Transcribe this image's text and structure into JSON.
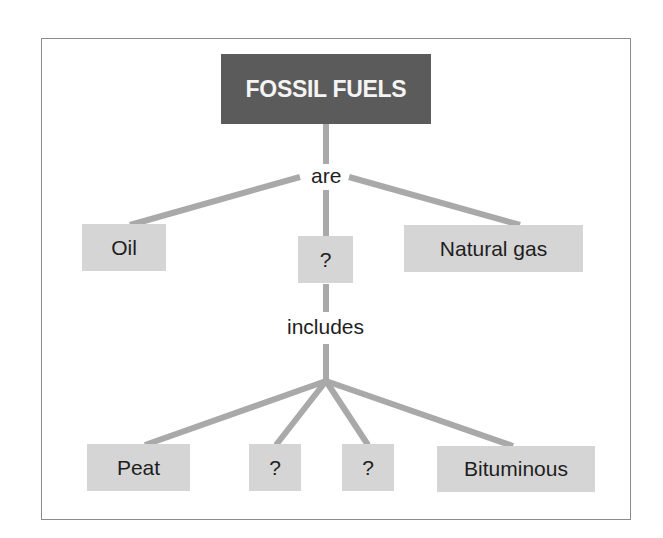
{
  "diagram": {
    "type": "concept-map",
    "colors": {
      "root_fill": "#5b5b5b",
      "root_text": "#f4f4f4",
      "node_fill": "#d5d5d5",
      "node_text": "#1e1e1e",
      "link": "#a9a9a9",
      "frame": "#8c8c8c"
    },
    "root": {
      "label": "FOSSIL FUELS"
    },
    "links": {
      "are": "are",
      "includes": "includes"
    },
    "level1": [
      {
        "label": "Oil"
      },
      {
        "label": "?"
      },
      {
        "label": "Natural gas"
      }
    ],
    "level2": [
      {
        "label": "Peat"
      },
      {
        "label": "?"
      },
      {
        "label": "?"
      },
      {
        "label": "Bituminous"
      }
    ]
  }
}
